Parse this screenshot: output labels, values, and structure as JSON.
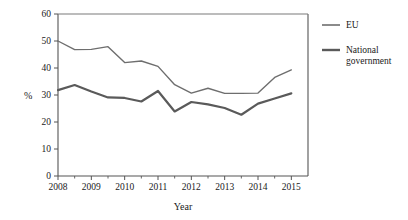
{
  "chart_data": {
    "type": "line",
    "title": "",
    "xlabel": "Year",
    "ylabel": "%",
    "ylim": [
      0,
      60
    ],
    "xlim": [
      2008,
      2015.5
    ],
    "ytick_values": [
      0,
      10,
      20,
      30,
      40,
      50,
      60
    ],
    "ytick_labels": [
      "0",
      "10",
      "20",
      "30",
      "40",
      "50",
      "60"
    ],
    "xtick_values": [
      2008,
      2009,
      2010,
      2011,
      2012,
      2013,
      2014,
      2015
    ],
    "xtick_labels": [
      "2008",
      "2009",
      "2010",
      "2011",
      "2012",
      "2013",
      "2014",
      "2015"
    ],
    "minor_xticks": [
      2008.5,
      2009.5,
      2010.5,
      2011.5,
      2012.5,
      2013.5,
      2014.5
    ],
    "grid": false,
    "legend_position": "right",
    "x": [
      2008,
      2008.5,
      2009,
      2009.5,
      2010,
      2010.5,
      2011,
      2011.5,
      2012,
      2012.5,
      2013,
      2013.5,
      2014,
      2014.5,
      2015
    ],
    "series": [
      {
        "name": "EU",
        "color": "#6e6e6e",
        "linewidth": 1.4,
        "values": [
          50.0,
          46.8,
          46.9,
          47.9,
          42.0,
          42.6,
          40.6,
          33.8,
          30.7,
          32.5,
          30.6,
          30.6,
          30.7,
          36.5,
          39.3
        ]
      },
      {
        "name": "National government",
        "color": "#5a5a5a",
        "linewidth": 2.2,
        "values": [
          31.8,
          33.7,
          31.3,
          29.1,
          28.9,
          27.6,
          31.5,
          23.9,
          27.4,
          26.5,
          25.2,
          22.7,
          26.8,
          28.7,
          30.6
        ]
      }
    ]
  },
  "legend": {
    "items": [
      {
        "label": "EU",
        "line2": ""
      },
      {
        "label": "National",
        "line2": "government"
      }
    ]
  },
  "axes": {
    "y_axis_label": "%",
    "x_axis_label": "Year"
  }
}
